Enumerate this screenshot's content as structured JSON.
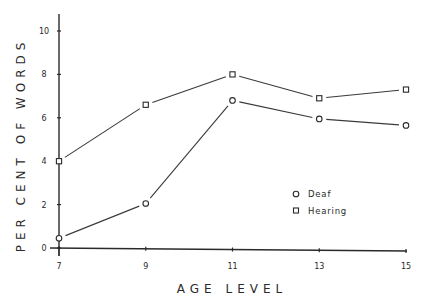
{
  "chart_data": {
    "type": "line",
    "title": "",
    "xlabel": "AGE LEVEL",
    "ylabel": "PER CENT OF WORDS",
    "x": [
      7,
      9,
      11,
      13,
      15
    ],
    "x_ticks": [
      "7",
      "9",
      "11",
      "13",
      "15"
    ],
    "y_ticks": [
      "0",
      "2",
      "4",
      "6",
      "8",
      "10"
    ],
    "xlim": [
      7,
      15
    ],
    "ylim": [
      0,
      10.8
    ],
    "grid": false,
    "legend_position": "right-center, inside plot",
    "series": [
      {
        "name": "Deaf",
        "marker": "circle",
        "values": [
          0.45,
          2.05,
          6.8,
          5.95,
          5.65
        ]
      },
      {
        "name": "Hearing",
        "marker": "square",
        "values": [
          4.0,
          6.6,
          8.0,
          6.9,
          7.3
        ]
      }
    ],
    "colors": {
      "line": "#3a3a3a",
      "text": "#2a2a2a",
      "background": "#ffffff"
    }
  },
  "axes": {
    "x_title": "AGE LEVEL",
    "y_title": "PER CENT OF WORDS",
    "x_tick_labels": [
      "7",
      "9",
      "11",
      "13",
      "15"
    ],
    "y_tick_labels": [
      "0",
      "2",
      "4",
      "6",
      "8",
      "10"
    ]
  },
  "legend": {
    "items": [
      {
        "label": "Deaf",
        "marker": "circle"
      },
      {
        "label": "Hearing",
        "marker": "square"
      }
    ]
  }
}
